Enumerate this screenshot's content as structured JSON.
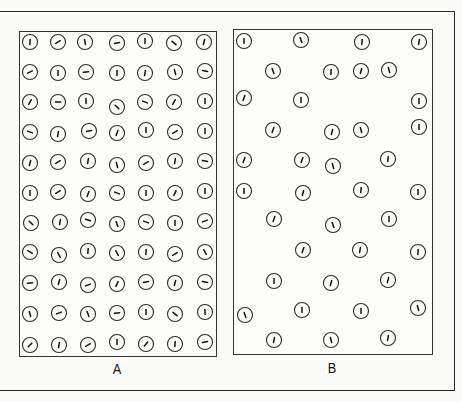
{
  "figure": {
    "panels": [
      {
        "label": "A",
        "description": "Densely packed regular grid of circles each containing a short oriented line segment",
        "rows": 11,
        "columns": 7,
        "circle_radius": 7.5,
        "circles": [
          {
            "x": 30,
            "y": 42,
            "a": 5
          },
          {
            "x": 58,
            "y": 42,
            "a": 60
          },
          {
            "x": 85,
            "y": 42,
            "a": -10
          },
          {
            "x": 117,
            "y": 43,
            "a": 80
          },
          {
            "x": 145,
            "y": 41,
            "a": 0
          },
          {
            "x": 174,
            "y": 43,
            "a": -50
          },
          {
            "x": 204,
            "y": 42,
            "a": 15
          },
          {
            "x": 30,
            "y": 72,
            "a": 65
          },
          {
            "x": 58,
            "y": 73,
            "a": 0
          },
          {
            "x": 86,
            "y": 72,
            "a": 85
          },
          {
            "x": 117,
            "y": 73,
            "a": 0
          },
          {
            "x": 145,
            "y": 73,
            "a": 10
          },
          {
            "x": 175,
            "y": 72,
            "a": -15
          },
          {
            "x": 205,
            "y": 71,
            "a": -80
          },
          {
            "x": 30,
            "y": 102,
            "a": 30
          },
          {
            "x": 58,
            "y": 102,
            "a": 90
          },
          {
            "x": 86,
            "y": 101,
            "a": 0
          },
          {
            "x": 117,
            "y": 107,
            "a": -45
          },
          {
            "x": 145,
            "y": 102,
            "a": -70
          },
          {
            "x": 174,
            "y": 102,
            "a": 30
          },
          {
            "x": 205,
            "y": 101,
            "a": 0
          },
          {
            "x": 30,
            "y": 132,
            "a": -70
          },
          {
            "x": 58,
            "y": 134,
            "a": 10
          },
          {
            "x": 89,
            "y": 131,
            "a": 80
          },
          {
            "x": 117,
            "y": 133,
            "a": 20
          },
          {
            "x": 146,
            "y": 130,
            "a": 0
          },
          {
            "x": 175,
            "y": 132,
            "a": 60
          },
          {
            "x": 205,
            "y": 131,
            "a": 0
          },
          {
            "x": 30,
            "y": 163,
            "a": 15
          },
          {
            "x": 58,
            "y": 162,
            "a": 60
          },
          {
            "x": 88,
            "y": 161,
            "a": 10
          },
          {
            "x": 117,
            "y": 165,
            "a": -15
          },
          {
            "x": 146,
            "y": 163,
            "a": 60
          },
          {
            "x": 175,
            "y": 161,
            "a": 10
          },
          {
            "x": 205,
            "y": 161,
            "a": -80
          },
          {
            "x": 30,
            "y": 193,
            "a": 0
          },
          {
            "x": 58,
            "y": 192,
            "a": 60
          },
          {
            "x": 88,
            "y": 194,
            "a": 20
          },
          {
            "x": 117,
            "y": 193,
            "a": -70
          },
          {
            "x": 146,
            "y": 193,
            "a": 0
          },
          {
            "x": 175,
            "y": 193,
            "a": 25
          },
          {
            "x": 205,
            "y": 191,
            "a": 0
          },
          {
            "x": 31,
            "y": 223,
            "a": -45
          },
          {
            "x": 60,
            "y": 222,
            "a": 10
          },
          {
            "x": 88,
            "y": 220,
            "a": -75
          },
          {
            "x": 117,
            "y": 224,
            "a": -20
          },
          {
            "x": 146,
            "y": 222,
            "a": -70
          },
          {
            "x": 175,
            "y": 223,
            "a": 0
          },
          {
            "x": 205,
            "y": 221,
            "a": 70
          },
          {
            "x": 30,
            "y": 252,
            "a": -60
          },
          {
            "x": 59,
            "y": 255,
            "a": -30
          },
          {
            "x": 88,
            "y": 251,
            "a": 5
          },
          {
            "x": 117,
            "y": 253,
            "a": -30
          },
          {
            "x": 146,
            "y": 252,
            "a": 5
          },
          {
            "x": 175,
            "y": 254,
            "a": 60
          },
          {
            "x": 205,
            "y": 252,
            "a": -30
          },
          {
            "x": 30,
            "y": 283,
            "a": 85
          },
          {
            "x": 59,
            "y": 282,
            "a": 15
          },
          {
            "x": 88,
            "y": 285,
            "a": 70
          },
          {
            "x": 117,
            "y": 284,
            "a": 25
          },
          {
            "x": 146,
            "y": 282,
            "a": 80
          },
          {
            "x": 175,
            "y": 283,
            "a": 15
          },
          {
            "x": 205,
            "y": 282,
            "a": -80
          },
          {
            "x": 30,
            "y": 314,
            "a": -15
          },
          {
            "x": 59,
            "y": 313,
            "a": 70
          },
          {
            "x": 88,
            "y": 314,
            "a": -20
          },
          {
            "x": 117,
            "y": 313,
            "a": 85
          },
          {
            "x": 146,
            "y": 312,
            "a": 0
          },
          {
            "x": 175,
            "y": 314,
            "a": -50
          },
          {
            "x": 205,
            "y": 312,
            "a": -5
          },
          {
            "x": 30,
            "y": 345,
            "a": 45
          },
          {
            "x": 59,
            "y": 345,
            "a": 10
          },
          {
            "x": 88,
            "y": 345,
            "a": 60
          },
          {
            "x": 117,
            "y": 342,
            "a": 0
          },
          {
            "x": 146,
            "y": 344,
            "a": 40
          },
          {
            "x": 175,
            "y": 344,
            "a": 5
          },
          {
            "x": 205,
            "y": 342,
            "a": 80
          }
        ]
      },
      {
        "label": "B",
        "description": "Sparse staggered arrangement of circles each containing a near-vertical line segment",
        "circle_radius": 7.5,
        "circles": [
          {
            "x": 244,
            "y": 41,
            "a": 0
          },
          {
            "x": 301,
            "y": 40,
            "a": -20
          },
          {
            "x": 362,
            "y": 42,
            "a": 5
          },
          {
            "x": 419,
            "y": 42,
            "a": 10
          },
          {
            "x": 273,
            "y": 71,
            "a": -20
          },
          {
            "x": 331,
            "y": 72,
            "a": 5
          },
          {
            "x": 361,
            "y": 71,
            "a": 15
          },
          {
            "x": 389,
            "y": 70,
            "a": -15
          },
          {
            "x": 244,
            "y": 98,
            "a": 20
          },
          {
            "x": 301,
            "y": 100,
            "a": 0
          },
          {
            "x": 419,
            "y": 101,
            "a": 0
          },
          {
            "x": 273,
            "y": 130,
            "a": 20
          },
          {
            "x": 332,
            "y": 132,
            "a": 15
          },
          {
            "x": 361,
            "y": 130,
            "a": -15
          },
          {
            "x": 419,
            "y": 127,
            "a": 0
          },
          {
            "x": 244,
            "y": 160,
            "a": 20
          },
          {
            "x": 302,
            "y": 160,
            "a": 20
          },
          {
            "x": 333,
            "y": 166,
            "a": -15
          },
          {
            "x": 388,
            "y": 159,
            "a": 5
          },
          {
            "x": 244,
            "y": 191,
            "a": 0
          },
          {
            "x": 303,
            "y": 193,
            "a": 15
          },
          {
            "x": 361,
            "y": 190,
            "a": 5
          },
          {
            "x": 418,
            "y": 192,
            "a": 0
          },
          {
            "x": 274,
            "y": 219,
            "a": 20
          },
          {
            "x": 333,
            "y": 225,
            "a": -20
          },
          {
            "x": 389,
            "y": 219,
            "a": 0
          },
          {
            "x": 303,
            "y": 250,
            "a": 20
          },
          {
            "x": 360,
            "y": 250,
            "a": 10
          },
          {
            "x": 418,
            "y": 252,
            "a": 5
          },
          {
            "x": 274,
            "y": 281,
            "a": 0
          },
          {
            "x": 331,
            "y": 283,
            "a": 15
          },
          {
            "x": 388,
            "y": 280,
            "a": 15
          },
          {
            "x": 245,
            "y": 315,
            "a": -20
          },
          {
            "x": 302,
            "y": 310,
            "a": 0
          },
          {
            "x": 361,
            "y": 311,
            "a": 0
          },
          {
            "x": 418,
            "y": 308,
            "a": -15
          },
          {
            "x": 274,
            "y": 340,
            "a": 10
          },
          {
            "x": 331,
            "y": 340,
            "a": -15
          },
          {
            "x": 388,
            "y": 338,
            "a": 10
          }
        ]
      }
    ]
  }
}
